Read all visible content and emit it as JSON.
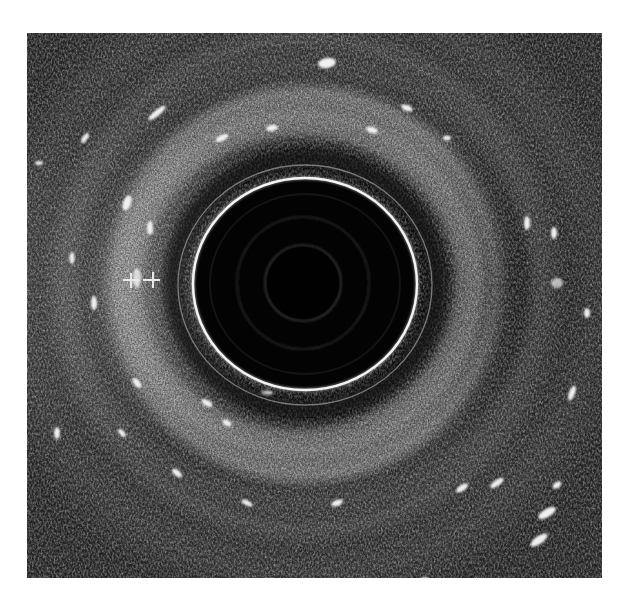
{
  "image": {
    "type": "endoscopic-ultrasound-radial",
    "frame": {
      "x": 27,
      "y": 33,
      "width": 575,
      "height": 545
    },
    "background": "#ffffff",
    "tissue_base_color": "#1c1c1c",
    "center": {
      "x": 278,
      "y": 251
    },
    "transducer_ring": {
      "rx": 112,
      "ry": 106,
      "stroke": "#f2f2f2",
      "width": 2.6
    },
    "outer_ring": {
      "rx": 128,
      "ry": 121,
      "stroke": "#9a9a9a",
      "width": 1.2
    },
    "inner_faint_rings": [
      {
        "r": 38,
        "stroke": "#2e2e2e"
      },
      {
        "r": 66,
        "stroke": "#262626"
      }
    ],
    "lumen_color": "#020202",
    "bands": [
      {
        "name": "hypoechoic-inner",
        "r_from": 112,
        "r_to": 150,
        "color": "#141414"
      },
      {
        "name": "hyperechoic-submucosa",
        "r_from": 150,
        "r_to": 185,
        "color": "#7a7a7a"
      },
      {
        "name": "hypoechoic-muscularis",
        "r_from": 185,
        "r_to": 215,
        "color": "#262626"
      },
      {
        "name": "hyperechoic-outer",
        "r_from": 215,
        "r_to": 240,
        "color": "#555555"
      }
    ]
  },
  "markers": {
    "label": "measurement calipers",
    "color": "#e8e8e8",
    "items": [
      {
        "symbol": "+",
        "x": 131,
        "y": 280
      },
      {
        "symbol": "+",
        "x": 153,
        "y": 280
      }
    ]
  }
}
